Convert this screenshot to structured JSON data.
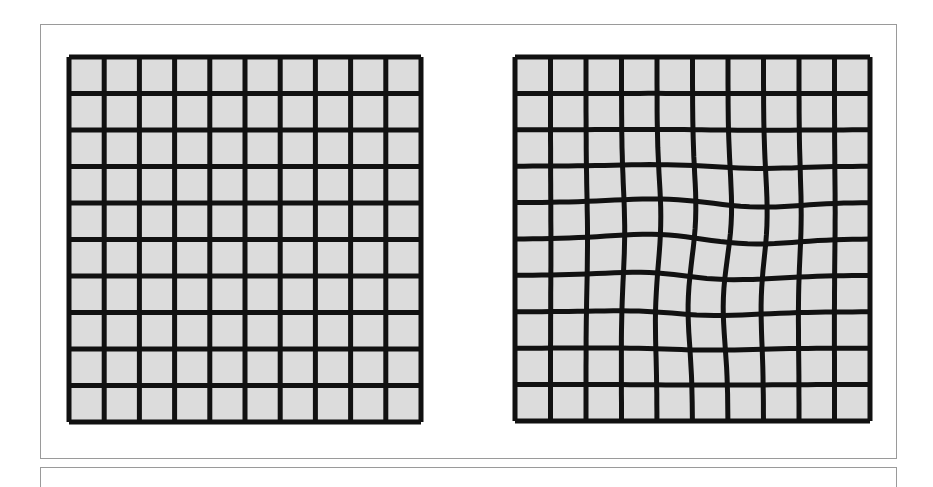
{
  "figure": {
    "panels": [
      {
        "id": "regular",
        "label": "undistorted grid",
        "rows": 10,
        "cols": 10,
        "width": 352,
        "height": 365,
        "warp": []
      },
      {
        "id": "warped",
        "label": "distorted grid",
        "rows": 10,
        "cols": 10,
        "width": 355,
        "height": 364,
        "warp": [
          {
            "cx": 150,
            "cy": 190,
            "dx": 6,
            "dy": -7,
            "r": 70
          },
          {
            "cx": 190,
            "cy": 230,
            "dx": -8,
            "dy": 6,
            "r": 65
          },
          {
            "cx": 240,
            "cy": 160,
            "dx": 4,
            "dy": 5,
            "r": 60
          }
        ]
      }
    ],
    "colors": {
      "cell_fill": "#dcdcdc",
      "line": "#111111",
      "frame": "#9a9a9a"
    },
    "line_width": 5
  }
}
